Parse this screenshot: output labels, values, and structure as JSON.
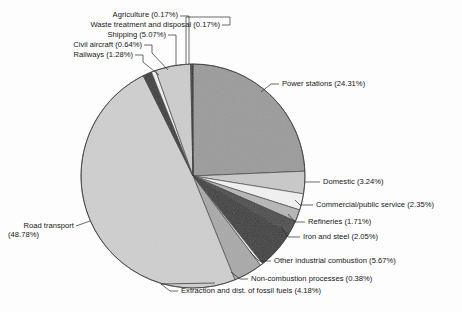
{
  "figure": {
    "background": "#fdfdfd",
    "chart_title": ""
  },
  "chart_data": {
    "type": "pie",
    "title": "",
    "subtitle": "",
    "xlabel": "",
    "ylabel": "",
    "legend_position": "none",
    "grid": false,
    "units": "percent",
    "label_format": "{name} ({value}%)",
    "total": 100.0,
    "start_angle_deg": -90,
    "direction": "clockwise",
    "center": {
      "x": 193,
      "y": 176
    },
    "radius": 112,
    "categories": [
      "Power stations",
      "Domestic",
      "Commercial/public service",
      "Refineries",
      "Iron and steel",
      "Other industrial combustion",
      "Non-combustion processes",
      "Extraction and dist. of fossil fuels",
      "Road transport",
      "Railways",
      "Civil aircraft",
      "Shipping",
      "Waste treatment and disposal",
      "Agriculture"
    ],
    "values": [
      24.31,
      3.24,
      2.35,
      1.71,
      2.05,
      5.67,
      0.38,
      4.18,
      48.78,
      1.28,
      0.64,
      5.07,
      0.17,
      0.17
    ],
    "slice_colors": [
      "#9b9b9b",
      "#c9c9c9",
      "#f2f2f2",
      "#b6b6b6",
      "#4a4a4a",
      "#3d3d3d",
      "#ededed",
      "#a9a9a9",
      "#cfcfcf",
      "#3a3a3a",
      "#efefef",
      "#cdcdcd",
      "#737373",
      "#2f2f2f"
    ],
    "slices": [
      {
        "name": "Power stations",
        "value": 24.31,
        "label": "Power stations (24.31%)",
        "color": "#9b9b9b"
      },
      {
        "name": "Domestic",
        "value": 3.24,
        "label": "Domestic (3.24%)",
        "color": "#c9c9c9"
      },
      {
        "name": "Commercial/public service",
        "value": 2.35,
        "label": "Commercial/public service (2.35%)",
        "color": "#f2f2f2"
      },
      {
        "name": "Refineries",
        "value": 1.71,
        "label": "Refineries (1.71%)",
        "color": "#b6b6b6"
      },
      {
        "name": "Iron and steel",
        "value": 2.05,
        "label": "Iron and steel (2.05%)",
        "color": "#4a4a4a"
      },
      {
        "name": "Other industrial combustion",
        "value": 5.67,
        "label": "Other industrial combustion (5.67%)",
        "color": "#3d3d3d"
      },
      {
        "name": "Non-combustion processes",
        "value": 0.38,
        "label": "Non-combustion processes (0.38%)",
        "color": "#ededed"
      },
      {
        "name": "Extraction and dist. of fossil fuels",
        "value": 4.18,
        "label": "Extraction and dist. of fossil fuels (4.18%)",
        "color": "#a9a9a9"
      },
      {
        "name": "Road transport",
        "value": 48.78,
        "label": "Road transport (48.78%)",
        "color": "#cfcfcf"
      },
      {
        "name": "Railways",
        "value": 1.28,
        "label": "Railways (1.28%)",
        "color": "#3a3a3a"
      },
      {
        "name": "Civil aircraft",
        "value": 0.64,
        "label": "Civil aircraft (0.64%)",
        "color": "#efefef"
      },
      {
        "name": "Shipping",
        "value": 5.07,
        "label": "Shipping (5.07%)",
        "color": "#cdcdcd"
      },
      {
        "name": "Waste treatment and disposal",
        "value": 0.17,
        "label": "Waste treatment and disposal (0.17%)",
        "color": "#737373"
      },
      {
        "name": "Agriculture",
        "value": 0.17,
        "label": "Agriculture (0.17%)",
        "color": "#2f2f2f"
      }
    ]
  },
  "labels": {
    "agriculture": "Agriculture (0.17%)",
    "waste": "Waste treatment and disposal (0.17%)",
    "shipping": "Shipping (5.07%)",
    "civil_aircraft": "Civil aircraft (0.64%)",
    "railways": "Railways (1.28%)",
    "power_stations": "Power stations (24.31%)",
    "domestic": "Domestic (3.24%)",
    "commercial": "Commercial/public service (2.35%)",
    "refineries": "Refineries (1.71%)",
    "iron_steel": "Iron and steel (2.05%)",
    "other_industrial": "Other industrial combustion (5.67%)",
    "non_combustion": "Non-combustion processes (0.38%)",
    "extraction": "Extraction and dist. of fossil fuels (4.18%)",
    "road_transport_line1": "Road transport",
    "road_transport_line2": "(48.78%)"
  }
}
